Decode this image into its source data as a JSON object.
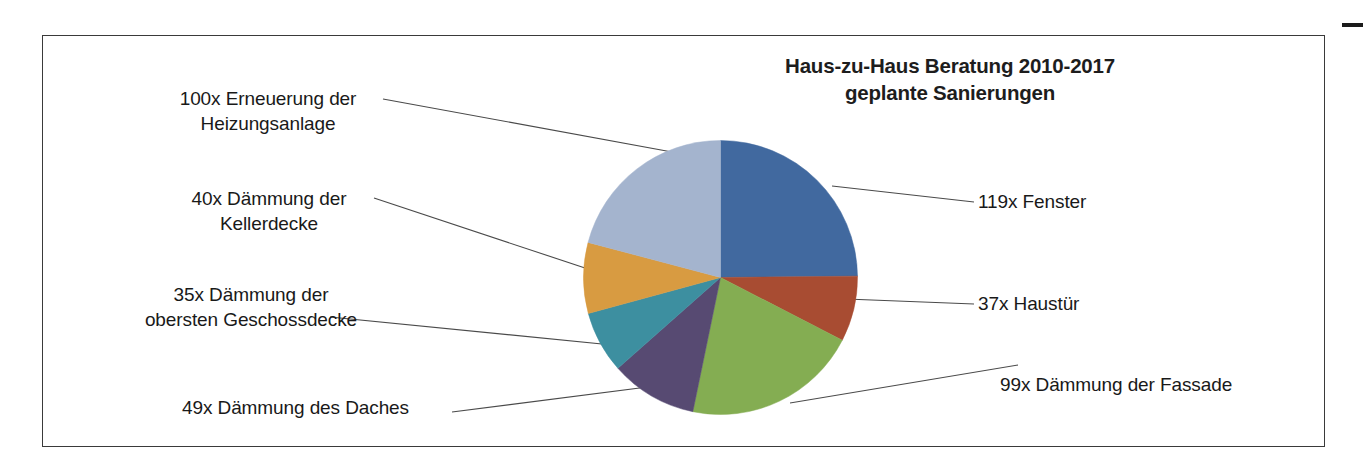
{
  "document": {
    "frame_border_color": "#3a3a3a",
    "background_color": "#ffffff",
    "edge_mark_color": "#1b1b1b"
  },
  "chart_title": {
    "line1": "Haus-zu-Haus Beratung 2010-2017",
    "line2": "geplante Sanierungen"
  },
  "labels": {
    "heizung": "100x Erneuerung der Heizungsanlage",
    "heizung_line1": "100x Erneuerung der",
    "heizung_line2": "Heizungsanlage",
    "kellerdecke_line1": "40x Dämmung der",
    "kellerdecke_line2": "Kellerdecke",
    "geschossdecke_line1": "35x Dämmung der",
    "geschossdecke_line2": "obersten Geschossdecke",
    "dach": "49x Dämmung des Daches",
    "fenster": "119x Fenster",
    "haustuer": "37x Haustür",
    "fassade": "99x Dämmung der Fassade"
  },
  "chart_data": {
    "type": "pie",
    "title": "Haus-zu-Haus Beratung 2010-2017 geplante Sanierungen",
    "xlabel": "",
    "ylabel": "",
    "total": 479,
    "units": "Anzahl geplanter Sanierungen",
    "legend_position": "callout-labels",
    "grid": false,
    "start_angle_deg": 0,
    "direction": "clockwise",
    "categories": [
      "Fenster",
      "Haustür",
      "Dämmung der Fassade",
      "Dämmung des Daches",
      "Dämmung der obersten Geschossdecke",
      "Dämmung der Kellerdecke",
      "Erneuerung der Heizungsanlage"
    ],
    "values": [
      119,
      37,
      99,
      49,
      35,
      40,
      100
    ],
    "value_labels": [
      "119x Fenster",
      "37x Haustür",
      "99x Dämmung der Fassade",
      "49x Dämmung des Daches",
      "35x Dämmung der obersten Geschossdecke",
      "40x Dämmung der Kellerdecke",
      "100x Erneuerung der Heizungsanlage"
    ],
    "colors": [
      "#41699f",
      "#a84c32",
      "#84ad52",
      "#574a72",
      "#3d8fa0",
      "#d89b41",
      "#a4b4ce"
    ]
  }
}
